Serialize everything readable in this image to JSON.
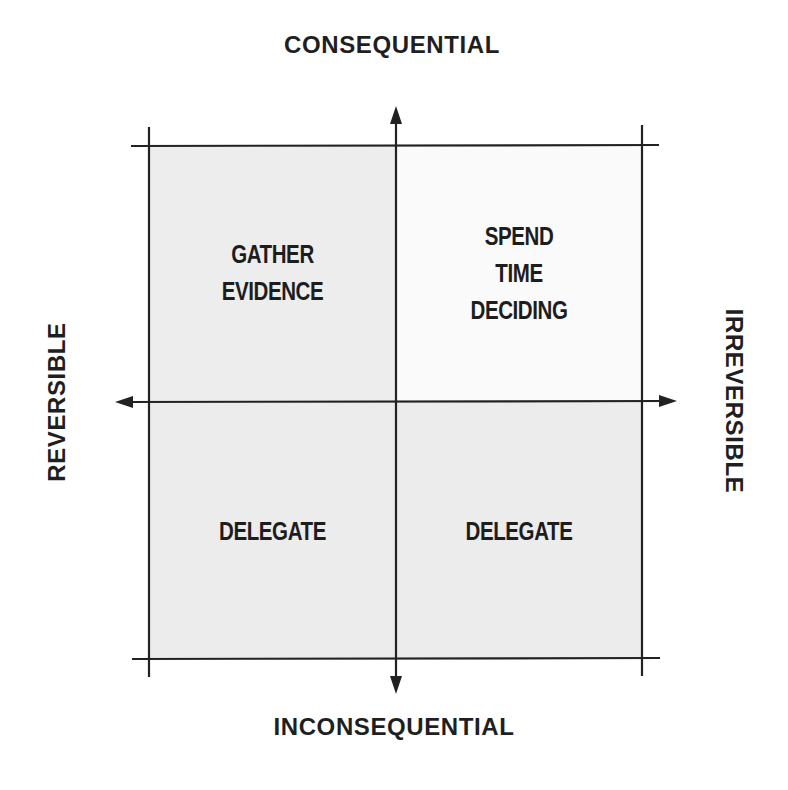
{
  "diagram": {
    "type": "2x2 decision matrix",
    "axes": {
      "vertical": {
        "top_label": "CONSEQUENTIAL",
        "bottom_label": "INCONSEQUENTIAL"
      },
      "horizontal": {
        "left_label": "REVERSIBLE",
        "right_label": "IRREVERSIBLE"
      }
    },
    "quadrants": {
      "top_left": {
        "lines": [
          "GATHER",
          "EVIDENCE"
        ],
        "fill": "#ededed"
      },
      "top_right": {
        "lines": [
          "SPEND",
          "TIME",
          "DECIDING"
        ],
        "fill": "#fafafa"
      },
      "bottom_left": {
        "lines": [
          "DELEGATE"
        ],
        "fill": "#ececec"
      },
      "bottom_right": {
        "lines": [
          "DELEGATE"
        ],
        "fill": "#ececec"
      }
    },
    "colors": {
      "line": "#222222",
      "text": "#1e1e1e",
      "background": "#ffffff"
    }
  }
}
